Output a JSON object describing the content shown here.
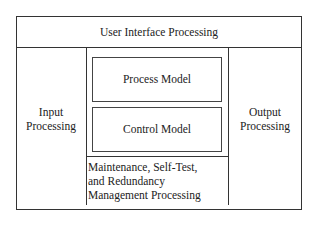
{
  "diagram": {
    "header": {
      "label": "User Interface Processing"
    },
    "left": {
      "line1": "Input",
      "line2": "Processing"
    },
    "right": {
      "line1": "Output",
      "line2": "Processing"
    },
    "center": {
      "process_model": "Process Model",
      "control_model": "Control Model",
      "maintenance": {
        "line1": "Maintenance, Self-Test,",
        "line2": "and Redundancy",
        "line3": "Management Processing"
      }
    }
  }
}
